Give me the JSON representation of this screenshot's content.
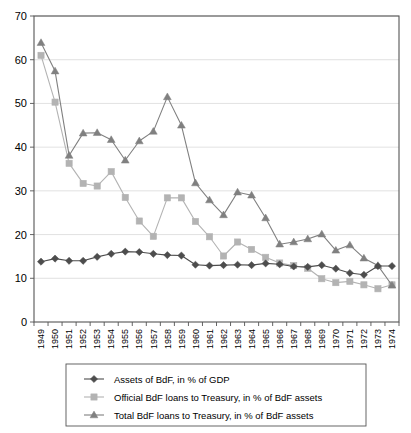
{
  "chart_data": {
    "type": "line",
    "title": "",
    "subtitle": "",
    "xlabel": "",
    "ylabel": "",
    "ylim": [
      0,
      70
    ],
    "ytick_values": [
      0,
      10,
      20,
      30,
      40,
      50,
      60,
      70
    ],
    "grid": true,
    "legend_position": "bottom",
    "x": [
      1949,
      1950,
      1951,
      1952,
      1953,
      1954,
      1955,
      1956,
      1957,
      1958,
      1959,
      1960,
      1961,
      1962,
      1963,
      1964,
      1965,
      1966,
      1967,
      1968,
      1969,
      1970,
      1971,
      1972,
      1973,
      1974
    ],
    "categories": [
      "1949",
      "1950",
      "1951",
      "1952",
      "1953",
      "1954",
      "1955",
      "1956",
      "1957",
      "1958",
      "1959",
      "1960",
      "1961",
      "1962",
      "1963",
      "1964",
      "1965",
      "1966",
      "1967",
      "1968",
      "1969",
      "1970",
      "1971",
      "1972",
      "1973",
      "1974"
    ],
    "series": [
      {
        "name": "Assets of BdF, in % of GDP",
        "marker": "diamond",
        "color": "#4d4d4d",
        "values": [
          13.8,
          14.5,
          14.0,
          14.0,
          14.9,
          15.6,
          16.1,
          16.0,
          15.6,
          15.3,
          15.2,
          13.1,
          12.9,
          13.0,
          13.1,
          13.0,
          13.4,
          13.2,
          12.7,
          12.6,
          13.0,
          12.2,
          11.2,
          10.8,
          12.8,
          12.8
        ]
      },
      {
        "name": "Official BdF loans to Treasury, in % of BdF assets",
        "marker": "square",
        "color": "#b3b3b3",
        "values": [
          61.0,
          50.3,
          36.3,
          31.7,
          31.1,
          34.4,
          28.5,
          23.1,
          19.6,
          28.4,
          28.4,
          23.0,
          19.5,
          15.1,
          18.3,
          16.6,
          14.8,
          13.5,
          12.9,
          12.3,
          9.9,
          9.0,
          9.3,
          8.5,
          7.6,
          8.5
        ]
      },
      {
        "name": "Total BdF loans to Treasury, in % of BdF assets",
        "marker": "triangle",
        "color": "#808080",
        "values": [
          63.9,
          57.4,
          38.1,
          43.2,
          43.3,
          41.7,
          37.0,
          41.4,
          43.6,
          51.5,
          45.0,
          31.8,
          27.9,
          24.5,
          29.7,
          29.0,
          23.8,
          17.8,
          18.3,
          19.0,
          20.1,
          16.4,
          17.6,
          14.6,
          12.9,
          8.4
        ]
      }
    ]
  },
  "axes": {
    "y_ticks": [
      "0",
      "10",
      "20",
      "30",
      "40",
      "50",
      "60",
      "70"
    ],
    "x_ticks": [
      "1949",
      "1950",
      "1951",
      "1952",
      "1953",
      "1954",
      "1955",
      "1956",
      "1957",
      "1958",
      "1959",
      "1960",
      "1961",
      "1962",
      "1963",
      "1964",
      "1965",
      "1966",
      "1967",
      "1968",
      "1969",
      "1970",
      "1971",
      "1972",
      "1973",
      "1974"
    ]
  },
  "legend": {
    "entries": [
      {
        "label": "Assets of BdF, in % of GDP",
        "marker": "diamond-marker-icon",
        "color": "#4d4d4d"
      },
      {
        "label": "Official BdF loans to Treasury, in % of BdF assets",
        "marker": "square-marker-icon",
        "color": "#b3b3b3"
      },
      {
        "label": "Total BdF loans to Treasury, in % of BdF assets",
        "marker": "triangle-marker-icon",
        "color": "#808080"
      }
    ]
  },
  "colors": {
    "assets_line": "#4d4d4d",
    "official_line": "#b3b3b3",
    "total_line": "#808080",
    "grid": "#d9d9d9",
    "axis": "#555555",
    "background": "#ffffff"
  }
}
